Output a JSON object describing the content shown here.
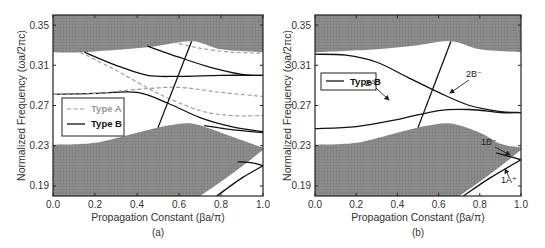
{
  "colors": {
    "band_fill": "#888888",
    "type_a": "#999999",
    "type_b": "#111111",
    "light_line": "#111111"
  },
  "chart_data": [
    {
      "panel": "(a)",
      "type": "line",
      "xlabel": "Propagation Constant (βa/π)",
      "ylabel": "Normalized Frequency (ωa/2πc)",
      "xlim": [
        0.0,
        1.0
      ],
      "ylim": [
        0.18,
        0.36
      ],
      "xticks": [
        "0.0",
        "0.2",
        "0.4",
        "0.6",
        "0.8",
        "1.0"
      ],
      "yticks": [
        "0.19",
        "0.23",
        "0.27",
        "0.31",
        "0.35"
      ],
      "legend": [
        {
          "label": "Type A",
          "style": "dashed",
          "color": "#999999"
        },
        {
          "label": "Type B",
          "style": "solid",
          "color": "#111111"
        }
      ],
      "legend_position": "middle-left",
      "shaded_regions": [
        {
          "name": "upper band",
          "lower_edge": {
            "x": [
              0.0,
              0.13,
              0.45,
              0.66,
              0.8,
              1.0
            ],
            "y": [
              0.323,
              0.323,
              0.328,
              0.334,
              0.326,
              0.323
            ]
          }
        },
        {
          "name": "lower band",
          "upper_edge": {
            "x": [
              0.0,
              0.2,
              0.4,
              0.55,
              0.66,
              0.8,
              1.0
            ],
            "y": [
              0.231,
              0.233,
              0.243,
              0.25,
              0.252,
              0.243,
              0.228
            ]
          }
        }
      ],
      "series": [
        {
          "name": "Type B mode 1",
          "style": "solid",
          "x": [
            0.15,
            0.3,
            0.45,
            0.6,
            0.8,
            1.0
          ],
          "y": [
            0.323,
            0.31,
            0.3,
            0.299,
            0.3,
            0.3
          ]
        },
        {
          "name": "Type B mode 2",
          "style": "solid",
          "x": [
            0.0,
            0.2,
            0.4,
            0.55,
            0.7,
            0.85,
            1.0
          ],
          "y": [
            0.281,
            0.282,
            0.283,
            0.272,
            0.258,
            0.249,
            0.244
          ]
        },
        {
          "name": "Type B mode 3",
          "style": "solid",
          "x": [
            0.45,
            0.6,
            0.75,
            0.9,
            1.0
          ],
          "y": [
            0.329,
            0.318,
            0.308,
            0.301,
            0.3
          ]
        },
        {
          "name": "Type B mode 4",
          "style": "solid",
          "x": [
            0.72,
            0.85,
            1.0
          ],
          "y": [
            0.25,
            0.246,
            0.243
          ]
        },
        {
          "name": "Type A mode 1",
          "style": "dashed",
          "x": [
            0.13,
            0.3,
            0.5,
            0.7,
            0.85,
            1.0
          ],
          "y": [
            0.323,
            0.305,
            0.282,
            0.265,
            0.26,
            0.26
          ]
        },
        {
          "name": "Type A mode 2",
          "style": "dashed",
          "x": [
            0.0,
            0.2,
            0.4,
            0.6,
            0.8,
            1.0
          ],
          "y": [
            0.281,
            0.282,
            0.286,
            0.288,
            0.283,
            0.279
          ]
        },
        {
          "name": "Type A mode 3",
          "style": "dashed",
          "x": [
            0.57,
            0.7,
            0.85,
            1.0
          ],
          "y": [
            0.333,
            0.327,
            0.323,
            0.322
          ]
        },
        {
          "name": "light line",
          "style": "solid",
          "x": [
            0.5,
            0.66
          ],
          "y": [
            0.248,
            0.334
          ]
        },
        {
          "name": "lower guided mode",
          "style": "solid",
          "x": [
            0.78,
            0.9,
            1.0
          ],
          "y": [
            0.18,
            0.198,
            0.21
          ]
        },
        {
          "name": "lower guided mode 2",
          "style": "solid",
          "x": [
            0.88,
            0.95,
            1.0
          ],
          "y": [
            0.214,
            0.213,
            0.21
          ]
        }
      ]
    },
    {
      "panel": "(b)",
      "type": "line",
      "xlabel": "Propagation Constant (βa/π)",
      "ylabel": "Normalized Frequency (ωa/2πc)",
      "xlim": [
        0.0,
        1.0
      ],
      "ylim": [
        0.18,
        0.36
      ],
      "xticks": [
        "0.0",
        "0.2",
        "0.4",
        "0.6",
        "0.8",
        "1.0"
      ],
      "yticks": [
        "0.19",
        "0.23",
        "0.27",
        "0.31",
        "0.35"
      ],
      "legend": [
        {
          "label": "Type B",
          "style": "solid",
          "color": "#111111"
        }
      ],
      "legend_position": "upper-left",
      "annotations": [
        {
          "text": "2B⁻",
          "points_to": [
            0.64,
            0.28
          ]
        },
        {
          "text": "2A⁺",
          "points_to": [
            0.36,
            0.254
          ]
        },
        {
          "text": "1B⁻",
          "points_to": [
            0.94,
            0.219
          ]
        },
        {
          "text": "1A⁺",
          "points_to": [
            0.91,
            0.205
          ]
        }
      ],
      "shaded_regions": [
        {
          "name": "upper band",
          "lower_edge": {
            "x": [
              0.0,
              0.3,
              0.5,
              0.66,
              0.8,
              1.0
            ],
            "y": [
              0.323,
              0.326,
              0.33,
              0.334,
              0.326,
              0.323
            ]
          }
        },
        {
          "name": "lower band",
          "upper_edge": {
            "x": [
              0.0,
              0.2,
              0.4,
              0.55,
              0.66,
              0.8,
              0.9,
              1.0
            ],
            "y": [
              0.231,
              0.233,
              0.243,
              0.25,
              0.252,
              0.243,
              0.232,
              0.228
            ]
          }
        }
      ],
      "series": [
        {
          "name": "2B⁻",
          "style": "solid",
          "x": [
            0.0,
            0.15,
            0.3,
            0.45,
            0.6,
            0.75,
            0.9,
            1.0
          ],
          "y": [
            0.321,
            0.32,
            0.313,
            0.298,
            0.283,
            0.27,
            0.264,
            0.263
          ]
        },
        {
          "name": "2A⁺",
          "style": "solid",
          "x": [
            0.0,
            0.2,
            0.4,
            0.6,
            0.75,
            0.9,
            1.0
          ],
          "y": [
            0.247,
            0.249,
            0.256,
            0.265,
            0.266,
            0.263,
            0.263
          ]
        },
        {
          "name": "light line",
          "style": "solid",
          "x": [
            0.5,
            0.66
          ],
          "y": [
            0.248,
            0.334
          ]
        },
        {
          "name": "1B⁻",
          "style": "solid",
          "x": [
            0.88,
            0.95,
            1.0
          ],
          "y": [
            0.223,
            0.219,
            0.216
          ]
        },
        {
          "name": "1A⁺",
          "style": "solid",
          "x": [
            0.72,
            0.85,
            1.0
          ],
          "y": [
            0.18,
            0.198,
            0.216
          ]
        }
      ]
    }
  ],
  "panels": {
    "a": {
      "label": "(a)",
      "xlabel": "Propagation Constant (βa/π)",
      "ylabel": "Normalized Frequency (ωa/2πc)",
      "legend_a": "Type A",
      "legend_b": "Type B"
    },
    "b": {
      "label": "(b)",
      "xlabel": "Propagation Constant (βa/π)",
      "ylabel": "Normalized Frequency (ωa/2πc)",
      "legend_b": "Type B",
      "ann_2b": "2B⁻",
      "ann_2a": "2A⁺",
      "ann_1b": "1B⁻",
      "ann_1a": "1A⁺"
    }
  }
}
